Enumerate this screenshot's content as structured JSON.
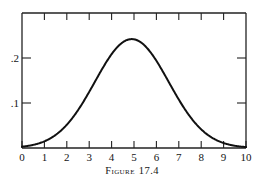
{
  "figure": {
    "caption_label": "Figure",
    "caption_number": "17.4",
    "caption_full": "FIGURE 17.4"
  },
  "chart_data": {
    "type": "line",
    "title": "",
    "subtitle": "",
    "xlabel": "",
    "ylabel": "",
    "xlim": [
      0,
      10
    ],
    "ylim": [
      0,
      0.27
    ],
    "grid": false,
    "legend": null,
    "annotations": [],
    "x_tick_labels": [
      "0",
      "1",
      "2",
      "3",
      "4",
      "5",
      "6",
      "7",
      "8",
      "9",
      "10"
    ],
    "x_ticks": [
      0,
      1,
      2,
      3,
      4,
      5,
      6,
      7,
      8,
      9,
      10
    ],
    "y_tick_labels": [
      ".1",
      ".2"
    ],
    "y_ticks": [
      0.1,
      0.2
    ],
    "line_color": "#111111",
    "line_width": 2.0,
    "axis_color": "#222222",
    "background": "#ffffff",
    "distribution": {
      "shape": "normal-bell",
      "mean": 4.9,
      "sigma": 1.65,
      "peak_value": 0.242,
      "peak_x": 4.9
    },
    "x": [
      0,
      0.25,
      0.5,
      0.75,
      1,
      1.25,
      1.5,
      1.75,
      2,
      2.25,
      2.5,
      2.75,
      3,
      3.25,
      3.5,
      3.75,
      4,
      4.25,
      4.5,
      4.75,
      5,
      5.25,
      5.5,
      5.75,
      6,
      6.25,
      6.5,
      6.75,
      7,
      7.25,
      7.5,
      7.75,
      8,
      8.25,
      8.5,
      8.75,
      9,
      9.25,
      9.5,
      9.75,
      10
    ],
    "values": [
      0.0019,
      0.0035,
      0.0062,
      0.0104,
      0.0168,
      0.0261,
      0.0389,
      0.0558,
      0.0769,
      0.1019,
      0.1299,
      0.1592,
      0.1876,
      0.2125,
      0.2316,
      0.2427,
      0.2446,
      0.2371,
      0.2212,
      0.1987,
      0.1719,
      0.1431,
      0.1146,
      0.0883,
      0.0654,
      0.0466,
      0.0319,
      0.021,
      0.0133,
      0.0081,
      0.0047,
      0.0026,
      0.0014,
      0.0007,
      0.0004,
      0.0002,
      0.0001,
      4e-05,
      2e-05,
      1e-05,
      4e-06
    ]
  },
  "axes": {
    "frame_style": "box",
    "tick_direction": "inward",
    "top_ticks_visible": true,
    "right_ticks_visible": true
  }
}
